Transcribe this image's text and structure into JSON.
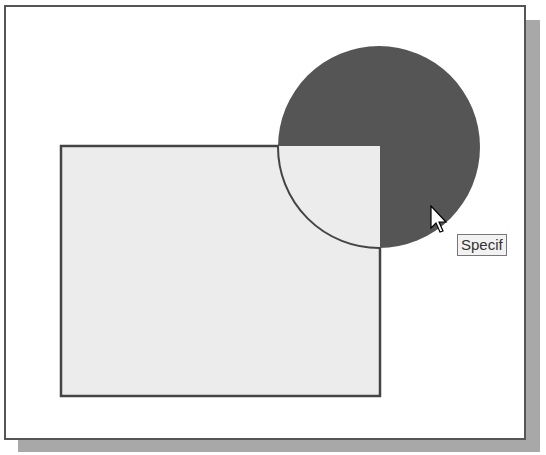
{
  "canvas": {
    "rectangle": {
      "x": 55,
      "y": 139,
      "width": 319,
      "height": 250,
      "fill": "#ececec",
      "stroke": "#444444"
    },
    "circle": {
      "cx": 373,
      "cy": 140,
      "r": 101,
      "fill": "#555555",
      "stroke": "#444444"
    },
    "cursor": {
      "x": 425,
      "y": 199
    }
  },
  "tooltip": {
    "text": "Specif"
  },
  "colors": {
    "frame_border": "#555555",
    "shadow": "#a8a8a8",
    "background": "#ffffff"
  }
}
